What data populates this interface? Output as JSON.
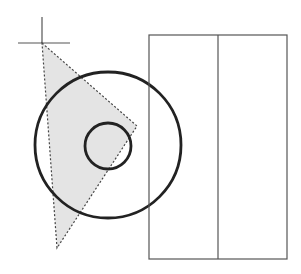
{
  "diagram": {
    "width": 301,
    "height": 274,
    "background": "#ffffff",
    "crosshair": {
      "center": [
        42,
        43
      ],
      "v_line": {
        "x": 42,
        "y1": 17,
        "y2": 43
      },
      "h_line": {
        "y": 43,
        "x1": 18,
        "x2": 70
      },
      "color": "#555555"
    },
    "triangle": {
      "points": "42,43 137,126 57,248",
      "fill": "#e4e4e4",
      "stroke": "#444444",
      "dash": "2,2"
    },
    "large_circle": {
      "cx": 108,
      "cy": 145,
      "r": 73,
      "stroke": "#222222",
      "stroke_width": 2.8
    },
    "small_circle": {
      "cx": 108,
      "cy": 146,
      "r": 23,
      "stroke": "#222222",
      "stroke_width": 2.8
    },
    "rectangle": {
      "x": 149,
      "y": 35,
      "width": 138,
      "height": 224,
      "divider_x": 218,
      "stroke": "#555555",
      "stroke_width": 1.2
    }
  }
}
